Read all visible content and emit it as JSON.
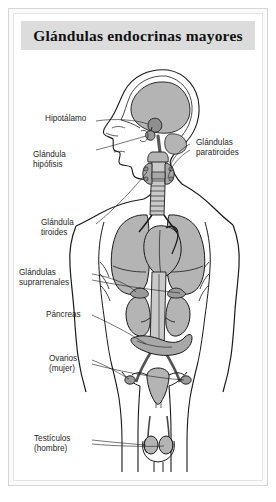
{
  "figure": {
    "title": "Glándulas endocrinas mayores",
    "kind": "anatomical-diagram",
    "language": "es",
    "colors": {
      "title_band": "#dcdcdc",
      "organ_fill": "#b4b4b4",
      "organ_fill_light": "#c9c9c9",
      "outline": "#1a1a1a",
      "label_text": "#262626",
      "frame": "#d6d6d6",
      "page": "#ffffff"
    }
  },
  "labels": [
    {
      "id": "hipotalamo",
      "text": "Hipotálamo",
      "side": "left",
      "lines": [
        "Hipotálamo"
      ]
    },
    {
      "id": "hipofisis",
      "text": "Glándula hipófisis",
      "side": "left",
      "lines": [
        "Glándula",
        "hipófisis"
      ]
    },
    {
      "id": "paratiroides",
      "text": "Glándulas paratiroides",
      "side": "right",
      "lines": [
        "Glándulas",
        "paratiroides"
      ]
    },
    {
      "id": "tiroides",
      "text": "Glándula tiroides",
      "side": "left",
      "lines": [
        "Glándula",
        "tiroides"
      ]
    },
    {
      "id": "suprarrenales",
      "text": "Glándulas suprarrenales",
      "side": "left",
      "lines": [
        "Glándulas",
        "suprarrenales"
      ]
    },
    {
      "id": "pancreas",
      "text": "Páncreas",
      "side": "left",
      "lines": [
        "Páncreas"
      ]
    },
    {
      "id": "ovarios",
      "text": "Ovarios (mujer)",
      "side": "left",
      "lines": [
        "Ovarios",
        "(mujer)"
      ]
    },
    {
      "id": "testiculos",
      "text": "Testículos (hombre)",
      "side": "left",
      "lines": [
        "Testículos",
        "(hombre)"
      ]
    }
  ],
  "label_lines": {
    "hipotalamo_1": "Hipotálamo",
    "hipofisis_1": "Glándula",
    "hipofisis_2": "hipófisis",
    "paratiroides_1": "Glándulas",
    "paratiroides_2": "paratiroides",
    "tiroides_1": "Glándula",
    "tiroides_2": "tiroides",
    "suprarrenales_1": "Glándulas",
    "suprarrenales_2": "suprarrenales",
    "pancreas_1": "Páncreas",
    "ovarios_1": "Ovarios",
    "ovarios_2": "(mujer)",
    "testiculos_1": "Testículos",
    "testiculos_2": "(hombre)"
  },
  "anatomy_parts": [
    "cabeza-perfil",
    "cerebro",
    "hipotalamo",
    "hipofisis",
    "traquea",
    "glandula-tiroides",
    "glandulas-paratiroides",
    "pulmon-izquierdo",
    "pulmon-derecho",
    "corazon",
    "aorta",
    "rinon-izquierdo",
    "rinon-derecho",
    "glandula-suprarrenal-izquierda",
    "glandula-suprarrenal-derecha",
    "pancreas",
    "utero",
    "ovario-izquierdo",
    "ovario-derecho",
    "testiculo-izquierdo",
    "testiculo-derecho",
    "torso-contorno"
  ]
}
